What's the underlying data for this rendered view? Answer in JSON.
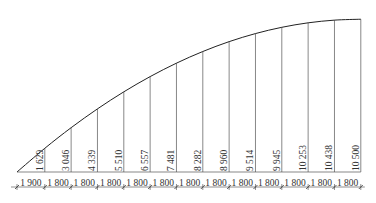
{
  "diagram": {
    "type": "arch-ordinate-profile",
    "start_x_px": 17,
    "baseline_y_px": 172,
    "dim_line_y_px": 187,
    "px_per_mm": 0.01463,
    "colors": {
      "curve": "#222222",
      "ordinate": "#555555",
      "text": "#333333",
      "dim": "#444444"
    },
    "spans": [
      1900,
      1800,
      1800,
      1800,
      1800,
      1800,
      1800,
      1800,
      1800,
      1800,
      1800,
      1800,
      1800
    ],
    "span_labels": [
      "1 900",
      "1 800",
      "1 800",
      "1 800",
      "1 800",
      "1 800",
      "1 800",
      "1 800",
      "1 800",
      "1 800",
      "1 800",
      "1 800",
      "1 800"
    ],
    "ordinates": [
      1629,
      3046,
      4339,
      5510,
      6557,
      7481,
      8282,
      8960,
      9514,
      9945,
      10253,
      10438,
      10500
    ],
    "ordinate_labels": [
      "1 629",
      "3 046",
      "4 339",
      "5 510",
      "6 557",
      "7 481",
      "8 282",
      "8 960",
      "9 514",
      "9 945",
      "10 253",
      "10 438",
      "10 500"
    ]
  }
}
